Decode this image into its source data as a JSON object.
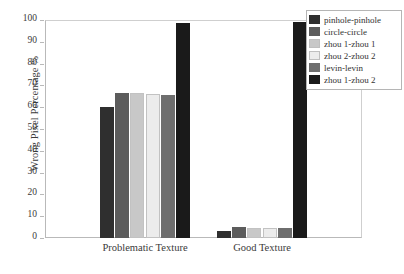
{
  "chart_data": {
    "type": "bar",
    "title": "",
    "xlabel": "",
    "ylabel": "Wrong Pixel Percentage %",
    "categories": [
      "Problematic Texture",
      "Good Texture"
    ],
    "ylim": [
      0,
      100
    ],
    "yticks": [
      0,
      10,
      20,
      30,
      40,
      50,
      60,
      70,
      80,
      90,
      100
    ],
    "ytick_labels": [
      "0",
      "10",
      "20",
      "30",
      "40",
      "50",
      "60",
      "70",
      "80",
      "90",
      "100"
    ],
    "grid": false,
    "legend_position": "top-right",
    "series": [
      {
        "name": "pinhole-pinhole",
        "color": "#2f2f2f",
        "values": [
          60,
          3
        ]
      },
      {
        "name": "circle-circle",
        "color": "#5c5c5c",
        "values": [
          66.5,
          5
        ]
      },
      {
        "name": "zhou 1-zhou 1",
        "color": "#c8c8c8",
        "values": [
          66.5,
          4.8
        ]
      },
      {
        "name": "zhou 2-zhou 2",
        "color": "#ececec",
        "values": [
          66,
          4.8
        ]
      },
      {
        "name": "levin-levin",
        "color": "#6e6e6e",
        "values": [
          65.5,
          4.5
        ]
      },
      {
        "name": "zhou 1-zhou 2",
        "color": "#1a1a1a",
        "values": [
          98.5,
          99
        ]
      }
    ]
  },
  "legend": {
    "items": [
      {
        "label": "pinhole-pinhole",
        "color": "#2f2f2f"
      },
      {
        "label": "circle-circle",
        "color": "#5c5c5c"
      },
      {
        "label": "zhou 1-zhou 1",
        "color": "#c8c8c8"
      },
      {
        "label": "zhou 2-zhou 2",
        "color": "#ececec"
      },
      {
        "label": "levin-levin",
        "color": "#6e6e6e"
      },
      {
        "label": "zhou 1-zhou 2",
        "color": "#1a1a1a"
      }
    ]
  }
}
